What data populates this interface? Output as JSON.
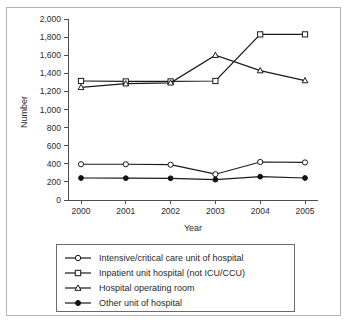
{
  "figure": {
    "title": "",
    "title_note": "clipped at top edge of screenshot",
    "frame_color": "#b4b4b4",
    "background": "#ffffff"
  },
  "chart_data": {
    "type": "line",
    "title": "",
    "xlabel": "Year",
    "ylabel": "Number",
    "categories": [
      "2000",
      "2001",
      "2002",
      "2003",
      "2004",
      "2005"
    ],
    "x": [
      2000,
      2001,
      2002,
      2003,
      2004,
      2005
    ],
    "ylim": [
      0,
      2000
    ],
    "yticks": [
      0,
      200,
      400,
      600,
      800,
      1000,
      1200,
      1400,
      1600,
      1800,
      2000
    ],
    "ytick_labels": [
      "0",
      "200",
      "400",
      "600",
      "800",
      "1,000",
      "1,200",
      "1,400",
      "1,600",
      "1,800",
      "2,000"
    ],
    "grid": false,
    "legend_position": "below-plot",
    "series": [
      {
        "name": "Intensive/critical care unit of hospital",
        "marker": "open-circle",
        "values": [
          395,
          395,
          390,
          285,
          420,
          415
        ]
      },
      {
        "name": "Inpatient unit hospital (not ICU/CCU)",
        "marker": "open-square",
        "values": [
          1315,
          1310,
          1310,
          1315,
          1830,
          1830
        ]
      },
      {
        "name": "Hospital operating room",
        "marker": "open-triangle",
        "values": [
          1245,
          1285,
          1295,
          1600,
          1430,
          1320
        ]
      },
      {
        "name": "Other unit of hospital",
        "marker": "filled-circle",
        "values": [
          243,
          241,
          240,
          225,
          258,
          243
        ]
      }
    ]
  },
  "axes": {
    "y_title": "Number",
    "x_title": "Year"
  },
  "legend": {
    "items": [
      {
        "label": "Intensive/critical care unit of hospital",
        "marker": "open-circle"
      },
      {
        "label": "Inpatient unit hospital (not ICU/CCU)",
        "marker": "open-square"
      },
      {
        "label": "Hospital operating room",
        "marker": "open-triangle"
      },
      {
        "label": "Other unit of hospital",
        "marker": "filled-circle"
      }
    ]
  }
}
